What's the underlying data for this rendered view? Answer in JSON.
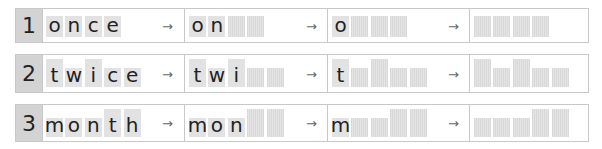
{
  "rows": [
    {
      "number": "1",
      "word": "once",
      "stages": [
        {
          "letters": [
            {
              "ch": "o",
              "tall": false
            },
            {
              "ch": "n",
              "tall": false
            },
            {
              "ch": "c",
              "tall": false
            },
            {
              "ch": "e",
              "tall": false
            }
          ]
        },
        {
          "letters": [
            {
              "ch": "o",
              "tall": false
            },
            {
              "ch": "n",
              "tall": false
            },
            {
              "ch": "",
              "tall": false
            },
            {
              "ch": "",
              "tall": false
            }
          ]
        },
        {
          "letters": [
            {
              "ch": "o",
              "tall": false
            },
            {
              "ch": "",
              "tall": false
            },
            {
              "ch": "",
              "tall": false
            },
            {
              "ch": "",
              "tall": false
            }
          ]
        },
        {
          "letters": [
            {
              "ch": "",
              "tall": false
            },
            {
              "ch": "",
              "tall": false
            },
            {
              "ch": "",
              "tall": false
            },
            {
              "ch": "",
              "tall": false
            }
          ]
        }
      ]
    },
    {
      "number": "2",
      "word": "twice",
      "stages": [
        {
          "letters": [
            {
              "ch": "t",
              "tall": true
            },
            {
              "ch": "w",
              "tall": false
            },
            {
              "ch": "i",
              "tall": true
            },
            {
              "ch": "c",
              "tall": false
            },
            {
              "ch": "e",
              "tall": false
            }
          ]
        },
        {
          "letters": [
            {
              "ch": "t",
              "tall": true
            },
            {
              "ch": "w",
              "tall": false
            },
            {
              "ch": "i",
              "tall": true
            },
            {
              "ch": "",
              "tall": false
            },
            {
              "ch": "",
              "tall": false
            }
          ]
        },
        {
          "letters": [
            {
              "ch": "t",
              "tall": true
            },
            {
              "ch": "",
              "tall": false
            },
            {
              "ch": "",
              "tall": true
            },
            {
              "ch": "",
              "tall": false
            },
            {
              "ch": "",
              "tall": false
            }
          ]
        },
        {
          "letters": [
            {
              "ch": "",
              "tall": true
            },
            {
              "ch": "",
              "tall": false
            },
            {
              "ch": "",
              "tall": true
            },
            {
              "ch": "",
              "tall": false
            },
            {
              "ch": "",
              "tall": false
            }
          ]
        }
      ]
    },
    {
      "number": "3",
      "word": "month",
      "stages": [
        {
          "letters": [
            {
              "ch": "m",
              "tall": false
            },
            {
              "ch": "o",
              "tall": false
            },
            {
              "ch": "n",
              "tall": false
            },
            {
              "ch": "t",
              "tall": true
            },
            {
              "ch": "h",
              "tall": true
            }
          ]
        },
        {
          "letters": [
            {
              "ch": "m",
              "tall": false
            },
            {
              "ch": "o",
              "tall": false
            },
            {
              "ch": "n",
              "tall": false
            },
            {
              "ch": "",
              "tall": true
            },
            {
              "ch": "",
              "tall": true
            }
          ]
        },
        {
          "letters": [
            {
              "ch": "m",
              "tall": false
            },
            {
              "ch": "",
              "tall": false
            },
            {
              "ch": "",
              "tall": false
            },
            {
              "ch": "",
              "tall": true
            },
            {
              "ch": "",
              "tall": true
            }
          ]
        },
        {
          "letters": [
            {
              "ch": "",
              "tall": false
            },
            {
              "ch": "",
              "tall": false
            },
            {
              "ch": "",
              "tall": false
            },
            {
              "ch": "",
              "tall": true
            },
            {
              "ch": "",
              "tall": true
            }
          ]
        }
      ]
    }
  ],
  "arrow_glyph": "→"
}
